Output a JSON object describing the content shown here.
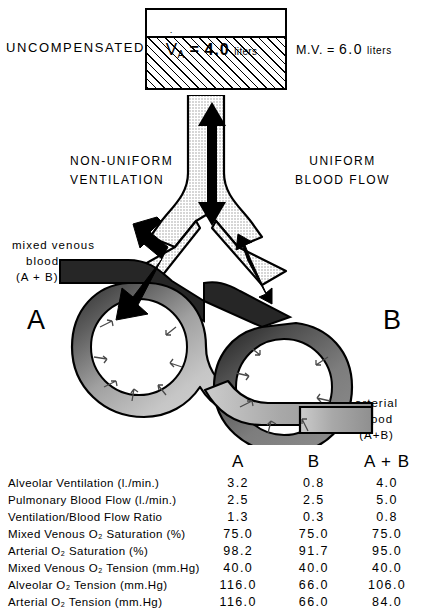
{
  "header": {
    "condition_label": "UNCOMPENSATED",
    "minute_volume": {
      "prefix": "M.V. =",
      "value": "6.0",
      "unit": "liters"
    },
    "alveolar_box": {
      "symbol": "V",
      "symbol_subscript": "A",
      "equals": "=",
      "value": "4.0",
      "unit": "liters"
    }
  },
  "captions": {
    "left_ventilation_line1": "NON-UNIFORM",
    "left_ventilation_line2": "VENTILATION",
    "right_flow_line1": "UNIFORM",
    "right_flow_line2": "BLOOD  FLOW",
    "mixed_venous_line1": "mixed venous",
    "mixed_venous_line2": "blood",
    "mixed_venous_line3": "(A + B)",
    "arterial_line1": "arterial",
    "arterial_line2": "blood",
    "arterial_line3": "(A+B)",
    "alveolus_a": "A",
    "alveolus_b": "B"
  },
  "table": {
    "columns": [
      "",
      "A",
      "B",
      "A + B"
    ],
    "rows": [
      {
        "label": "Alveolar Ventilation (l./min.)",
        "a": "3.2",
        "b": "0.8",
        "ab": "4.0"
      },
      {
        "label": "Pulmonary Blood Flow (l./min.)",
        "a": "2.5",
        "b": "2.5",
        "ab": "5.0"
      },
      {
        "label": "Ventilation/Blood Flow Ratio",
        "a": "1.3",
        "b": "0.3",
        "ab": "0.8"
      },
      {
        "label": "Mixed Venous O₂ Saturation (%)",
        "a": "75.0",
        "b": "75.0",
        "ab": "75.0"
      },
      {
        "label": "Arterial O₂ Saturation (%)",
        "a": "98.2",
        "b": "91.7",
        "ab": "95.0"
      },
      {
        "label": "Mixed Venous O₂ Tension (mm.Hg)",
        "a": "40.0",
        "b": "40.0",
        "ab": "40.0"
      },
      {
        "label": "Alveolar O₂ Tension (mm.Hg)",
        "a": "116.0",
        "b": "66.0",
        "ab": "106.0"
      },
      {
        "label": "Arterial O₂ Tension (mm.Hg)",
        "a": "116.0",
        "b": "66.0",
        "ab": "84.0"
      }
    ]
  },
  "colors": {
    "ink": "#000000",
    "venous_dark": "#262626",
    "arterial_light": "#c9c9c9",
    "airway_stipple": "#d8d8d8"
  }
}
